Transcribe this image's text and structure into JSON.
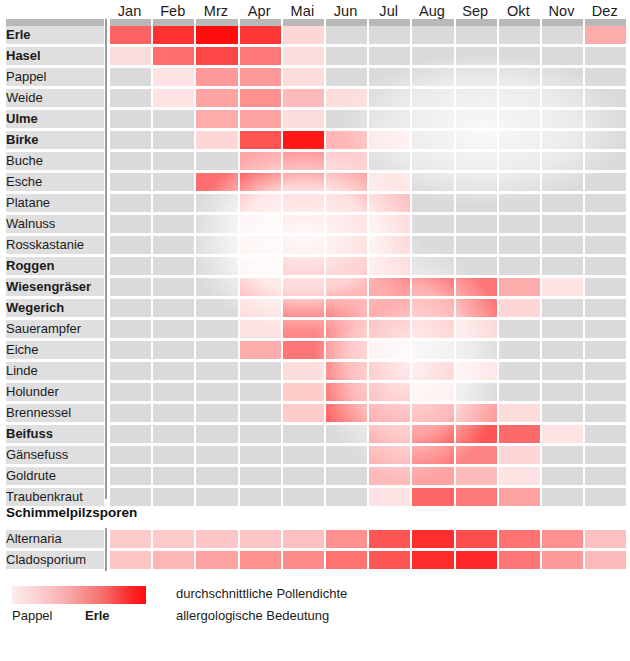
{
  "months": [
    "Jan",
    "Feb",
    "Mrz",
    "Apr",
    "Mai",
    "Jun",
    "Jul",
    "Aug",
    "Sep",
    "Okt",
    "Nov",
    "Dez"
  ],
  "section_heading": "Schimmelpilzsporen",
  "legend": {
    "left_label": "Pappel",
    "right_label": "Erle",
    "line1": "durchschnittliche Pollendichte",
    "line2": "allergologische Bedeutung",
    "gradient_from": "#fdecec",
    "gradient_to": "#ff0d0d"
  },
  "caption": "",
  "colors": {
    "empty_cell": "#dadada",
    "header_band": "#b9b9b9",
    "divider": "#9a9a9a",
    "max_red": "#ff0d0d"
  },
  "chart_data": {
    "type": "heatmap",
    "xlabel": "",
    "ylabel": "",
    "categories": [
      "Jan",
      "Feb",
      "Mrz",
      "Apr",
      "Mai",
      "Jun",
      "Jul",
      "Aug",
      "Sep",
      "Okt",
      "Nov",
      "Dez"
    ],
    "value_scale": [
      0,
      1
    ],
    "legend_position": "bottom-left",
    "grid": true,
    "series": [
      {
        "name": "Erle",
        "bold": true,
        "values": [
          0.55,
          0.8,
          1.0,
          0.78,
          0.06,
          0.0,
          0.0,
          0.0,
          0.0,
          0.0,
          0.0,
          0.22
        ]
      },
      {
        "name": "Hasel",
        "bold": true,
        "values": [
          0.04,
          0.5,
          0.7,
          0.45,
          0.04,
          0.0,
          0.0,
          0.0,
          0.0,
          0.0,
          0.0,
          0.0
        ]
      },
      {
        "name": "Pappel",
        "bold": false,
        "values": [
          0.0,
          0.02,
          0.3,
          0.3,
          0.04,
          0.0,
          0.0,
          0.0,
          0.0,
          0.0,
          0.0,
          0.0
        ]
      },
      {
        "name": "Weide",
        "bold": false,
        "values": [
          0.0,
          0.02,
          0.26,
          0.34,
          0.16,
          0.04,
          0.0,
          0.0,
          0.0,
          0.0,
          0.0,
          0.0
        ]
      },
      {
        "name": "Ulme",
        "bold": true,
        "values": [
          0.0,
          0.0,
          0.22,
          0.26,
          0.04,
          0.0,
          0.0,
          0.0,
          0.0,
          0.0,
          0.0,
          0.0
        ]
      },
      {
        "name": "Birke",
        "bold": true,
        "values": [
          0.0,
          0.0,
          0.06,
          0.62,
          0.95,
          0.18,
          0.02,
          0.0,
          0.0,
          0.0,
          0.0,
          0.0
        ]
      },
      {
        "name": "Buche",
        "bold": false,
        "values": [
          0.0,
          0.0,
          0.0,
          0.24,
          0.34,
          0.1,
          0.0,
          0.0,
          0.0,
          0.0,
          0.0,
          0.0
        ]
      },
      {
        "name": "Esche",
        "bold": false,
        "values": [
          0.0,
          0.0,
          0.5,
          0.72,
          0.6,
          0.36,
          0.02,
          0.0,
          0.0,
          0.0,
          0.0,
          0.0
        ]
      },
      {
        "name": "Platane",
        "bold": false,
        "values": [
          0.0,
          0.0,
          0.0,
          0.26,
          0.44,
          0.4,
          0.14,
          0.0,
          0.0,
          0.0,
          0.0,
          0.0
        ]
      },
      {
        "name": "Walnuss",
        "bold": false,
        "values": [
          0.0,
          0.0,
          0.0,
          0.04,
          0.36,
          0.34,
          0.06,
          0.0,
          0.0,
          0.0,
          0.0,
          0.0
        ]
      },
      {
        "name": "Rosskastanie",
        "bold": false,
        "values": [
          0.0,
          0.0,
          0.0,
          0.06,
          0.46,
          0.4,
          0.08,
          0.0,
          0.0,
          0.0,
          0.0,
          0.0
        ]
      },
      {
        "name": "Roggen",
        "bold": true,
        "values": [
          0.0,
          0.0,
          0.0,
          0.02,
          0.96,
          0.74,
          0.1,
          0.0,
          0.0,
          0.0,
          0.0,
          0.0
        ]
      },
      {
        "name": "Wiesengräser",
        "bold": true,
        "values": [
          0.0,
          0.0,
          0.0,
          0.26,
          0.6,
          0.76,
          0.92,
          0.66,
          0.46,
          0.22,
          0.02,
          0.0
        ]
      },
      {
        "name": "Wegerich",
        "bold": true,
        "values": [
          0.0,
          0.0,
          0.0,
          0.04,
          0.58,
          0.7,
          0.8,
          0.56,
          0.44,
          0.06,
          0.0,
          0.0
        ]
      },
      {
        "name": "Sauerampfer",
        "bold": false,
        "values": [
          0.0,
          0.0,
          0.0,
          0.02,
          0.38,
          0.44,
          0.52,
          0.3,
          0.06,
          0.0,
          0.0,
          0.0
        ]
      },
      {
        "name": "Eiche",
        "bold": false,
        "values": [
          0.0,
          0.0,
          0.0,
          0.22,
          0.46,
          0.38,
          0.04,
          0.0,
          0.0,
          0.0,
          0.0,
          0.0
        ]
      },
      {
        "name": "Linde",
        "bold": false,
        "values": [
          0.0,
          0.0,
          0.0,
          0.0,
          0.04,
          0.48,
          0.48,
          0.3,
          0.02,
          0.0,
          0.0,
          0.0
        ]
      },
      {
        "name": "Holunder",
        "bold": false,
        "values": [
          0.0,
          0.0,
          0.0,
          0.0,
          0.1,
          0.52,
          0.52,
          0.04,
          0.0,
          0.0,
          0.0,
          0.0
        ]
      },
      {
        "name": "Brennessel",
        "bold": false,
        "values": [
          0.0,
          0.0,
          0.0,
          0.0,
          0.1,
          0.56,
          0.62,
          0.58,
          0.28,
          0.04,
          0.0,
          0.0
        ]
      },
      {
        "name": "Beifuss",
        "bold": true,
        "values": [
          0.0,
          0.0,
          0.0,
          0.0,
          0.0,
          0.0,
          0.36,
          0.82,
          0.62,
          0.52,
          0.02,
          0.0
        ]
      },
      {
        "name": "Gänsefuss",
        "bold": false,
        "values": [
          0.0,
          0.0,
          0.0,
          0.0,
          0.0,
          0.0,
          0.22,
          0.48,
          0.4,
          0.06,
          0.0,
          0.0
        ]
      },
      {
        "name": "Goldrute",
        "bold": false,
        "values": [
          0.0,
          0.0,
          0.0,
          0.0,
          0.0,
          0.0,
          0.16,
          0.26,
          0.16,
          0.02,
          0.0,
          0.0
        ]
      },
      {
        "name": "Traubenkraut",
        "bold": false,
        "values": [
          0.0,
          0.0,
          0.0,
          0.0,
          0.0,
          0.0,
          0.02,
          0.54,
          0.44,
          0.26,
          0.0,
          0.0
        ]
      },
      {
        "name": "Alternaria",
        "bold": false,
        "group": "Schimmelpilzsporen",
        "values": [
          0.1,
          0.1,
          0.12,
          0.12,
          0.14,
          0.34,
          0.62,
          0.82,
          0.66,
          0.48,
          0.34,
          0.14
        ]
      },
      {
        "name": "Cladosporium",
        "bold": false,
        "group": "Schimmelpilzsporen",
        "values": [
          0.12,
          0.18,
          0.26,
          0.34,
          0.36,
          0.48,
          0.62,
          0.84,
          0.86,
          0.46,
          0.3,
          0.16
        ]
      }
    ]
  }
}
